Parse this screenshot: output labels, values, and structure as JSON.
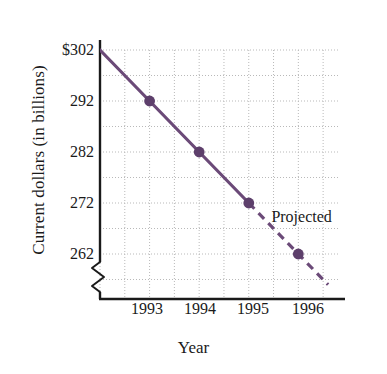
{
  "chart_data": {
    "type": "line",
    "title": "",
    "xlabel": "Year",
    "ylabel": "Current dollars (in billions)",
    "x": [
      1993,
      1994,
      1995,
      1996
    ],
    "values": [
      292,
      282,
      272,
      262
    ],
    "series": [
      {
        "name": "Current dollars",
        "segment": "actual",
        "style": "solid",
        "x": [
          1992,
          1993,
          1994,
          1995
        ],
        "values": [
          302,
          292,
          282,
          272
        ]
      },
      {
        "name": "Projected",
        "segment": "projected",
        "style": "dashed",
        "x": [
          1995,
          1996,
          1996.6
        ],
        "values": [
          272,
          262,
          256
        ]
      }
    ],
    "xticklabels": [
      "1993",
      "1994",
      "1995",
      "1996"
    ],
    "yticklabels": [
      "$302",
      "292",
      "282",
      "272",
      "262"
    ],
    "ytickvalues": [
      302,
      292,
      282,
      272,
      262
    ],
    "ylim": [
      257,
      302
    ],
    "xlim": [
      1991.5,
      1996.8
    ],
    "grid": true,
    "minor_grid": true,
    "axis_break": true,
    "legend": "none",
    "annotations": [
      {
        "text": "Projected",
        "x": 1995.9,
        "y": 269
      }
    ],
    "colors": {
      "line": "#6b4a78",
      "marker": "#5d3f6b",
      "grid": "#b9b9b9",
      "axis": "#1a1a1a",
      "background": "#ffffff"
    }
  }
}
